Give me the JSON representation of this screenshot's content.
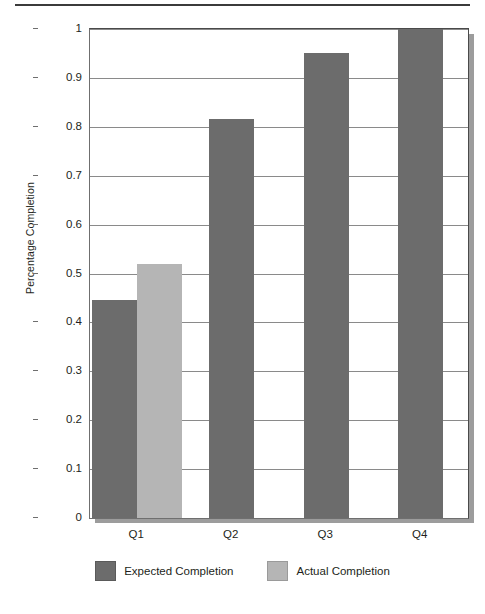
{
  "chart_data": {
    "type": "bar",
    "title": "",
    "subtitle": "",
    "xlabel": "",
    "ylabel": "Percentage Completion",
    "categories": [
      "Q1",
      "Q2",
      "Q3",
      "Q4"
    ],
    "series": [
      {
        "name": "Expected Completion",
        "color": "#6c6c6c",
        "values": [
          0.445,
          0.817,
          0.95,
          1.0
        ]
      },
      {
        "name": "Actual Completion",
        "color": "#b5b5b5",
        "values": [
          0.52,
          null,
          null,
          null
        ]
      }
    ],
    "ylim": [
      0,
      1
    ],
    "yticks": [
      0,
      0.1,
      0.2,
      0.3,
      0.4,
      0.5,
      0.6,
      0.7,
      0.8,
      0.9,
      1
    ],
    "ytick_labels": [
      "0",
      "0.1",
      "0.2",
      "0.3",
      "0.4",
      "0.5",
      "0.6",
      "0.7",
      "0.8",
      "0.9",
      "1"
    ],
    "grid": true,
    "grid_axis": "y",
    "legend_position": "bottom",
    "legend": [
      {
        "label": "Expected Completion",
        "color": "#6c6c6c"
      },
      {
        "label": "Actual Completion",
        "color": "#b5b5b5"
      }
    ]
  },
  "figure": {
    "background": "#ffffff",
    "frame_color": "#6f6f6f",
    "gridline_color": "#8a8a8a",
    "text_color": "#231f20",
    "shadow_color": "#9c9c9c",
    "top_rule_color": "#3b3b3b"
  }
}
